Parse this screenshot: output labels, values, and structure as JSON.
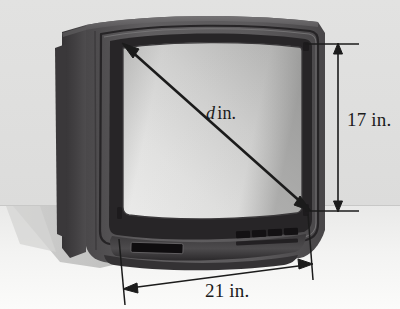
{
  "figure": {
    "name": "crt-television-dimension-diagram"
  },
  "labels": {
    "diagonal": {
      "symbol": "d",
      "unit": "in."
    },
    "height": {
      "value": "17",
      "unit": "in.",
      "text": "17 in."
    },
    "width": {
      "value": "21",
      "unit": "in.",
      "text": "21 in."
    }
  },
  "colors": {
    "page_background": "#fdfdfd",
    "wall": "#dededd",
    "floor": "#f2f2f1",
    "shadow": "#c9c9c8",
    "cabinet_front": "#5a585a",
    "cabinet_side": "#3e3c3e",
    "cabinet_top": "#6a686a",
    "bezel_dark": "#2e2c2e",
    "screen_light": "#e4e4e3",
    "screen_dark": "#a9a9a8",
    "ink": "#1b1b1b",
    "vent": "#151515"
  },
  "parts": {
    "screen": "screen",
    "bezel": "bezel",
    "cabinet": "cabinet",
    "left_side_panel": "left-side-panel",
    "control_slot": "control-slot",
    "speaker_vents": "speaker-vents",
    "floor_shadow": "floor-shadow",
    "horizon": "horizon-line"
  },
  "annotations": {
    "diagonal_arrow": "double-headed diagonal arrow across screen",
    "height_dimension": "vertical double-headed dimension arrow at right",
    "width_dimension": "horizontal double-headed dimension arrow at bottom"
  }
}
